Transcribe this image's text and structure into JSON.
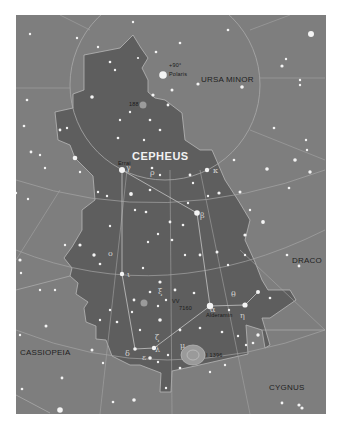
{
  "map": {
    "title": "CEPHEUS",
    "constellations": [
      {
        "name": "URSA MINOR",
        "x": 255,
        "y": 68
      },
      {
        "name": "DRACO",
        "x": 305,
        "y": 255
      },
      {
        "name": "CASSIOPEIA",
        "x": 42,
        "y": 350
      },
      {
        "name": "CYGNUS",
        "x": 280,
        "y": 387
      }
    ],
    "star_labels": {
      "pole": "+90°",
      "polaris": "Polaris",
      "errai": "Errai",
      "alderamin": "Alderamin",
      "vv": "VV",
      "ic1396": "I 1396",
      "ngc188": "188",
      "ic7160": "7160"
    },
    "greek_letters": [
      {
        "char": "γ",
        "x": 126,
        "y": 167
      },
      {
        "char": "ρ",
        "x": 150,
        "y": 172
      },
      {
        "char": "κ",
        "x": 213,
        "y": 170
      },
      {
        "char": "β",
        "x": 200,
        "y": 215
      },
      {
        "char": "ι",
        "x": 127,
        "y": 274
      },
      {
        "char": "ο",
        "x": 108,
        "y": 253
      },
      {
        "char": "ξ",
        "x": 158,
        "y": 291
      },
      {
        "char": "α",
        "x": 210,
        "y": 309
      },
      {
        "char": "η",
        "x": 240,
        "y": 315
      },
      {
        "char": "θ",
        "x": 231,
        "y": 294
      },
      {
        "char": "ζ",
        "x": 155,
        "y": 337
      },
      {
        "char": "δ",
        "x": 125,
        "y": 353
      },
      {
        "char": "ε",
        "x": 142,
        "y": 357
      },
      {
        "char": "λ",
        "x": 155,
        "y": 349
      },
      {
        "char": "μ",
        "x": 180,
        "y": 345
      }
    ],
    "colors": {
      "background": "#7e7e7e",
      "cepheus_fill": "#5e5e5e",
      "grid_line": "#a8a8a8",
      "boundary": "#b8b8b8",
      "star": "#f4f4f4",
      "nebula": "#9a9a9a"
    }
  }
}
